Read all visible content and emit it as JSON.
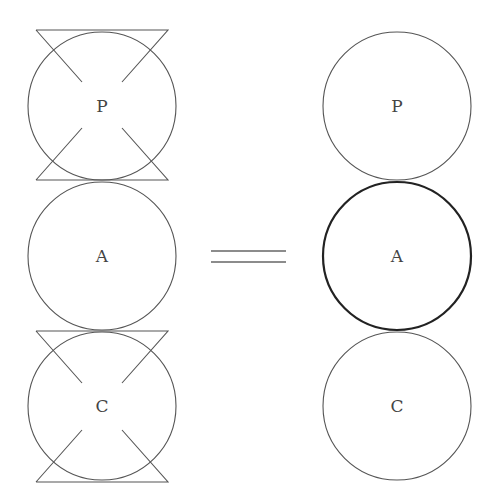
{
  "left": {
    "nodes": [
      {
        "label": "P",
        "cx": 102,
        "cy": 106,
        "r": 74,
        "crossed": true
      },
      {
        "label": "A",
        "cx": 102,
        "cy": 256,
        "r": 74,
        "crossed": false
      },
      {
        "label": "C",
        "cx": 102,
        "cy": 406,
        "r": 74,
        "crossed": true
      }
    ]
  },
  "equals": {
    "symbol": "="
  },
  "right": {
    "nodes": [
      {
        "label": "P",
        "cx": 397,
        "cy": 106,
        "r": 74,
        "bold": false
      },
      {
        "label": "A",
        "cx": 397,
        "cy": 256,
        "r": 74,
        "bold": true
      },
      {
        "label": "C",
        "cx": 397,
        "cy": 406,
        "r": 74,
        "bold": false
      }
    ]
  },
  "colors": {
    "stroke": "#555555",
    "bold_stroke": "#222222"
  }
}
